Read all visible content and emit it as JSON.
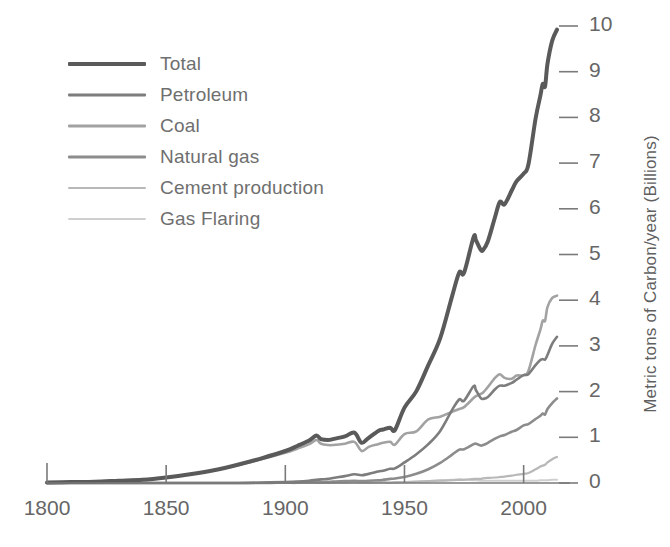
{
  "chart_data": {
    "type": "line",
    "title": "",
    "subtitle": "",
    "xlabel": "",
    "ylabel": "Metric tons of Carbon/year (Billions)",
    "xlim": [
      1800,
      2014
    ],
    "ylim": [
      0,
      10
    ],
    "xticks": [
      1800,
      1850,
      1900,
      1950,
      2000
    ],
    "xtick_labels": [
      "1800",
      "1850",
      "1900",
      "1950",
      "2000"
    ],
    "yticks": [
      0,
      1,
      2,
      3,
      4,
      5,
      6,
      7,
      8,
      9,
      10
    ],
    "ytick_labels": [
      "0",
      "1",
      "2",
      "3",
      "4",
      "5",
      "6",
      "7",
      "8",
      "9",
      "10"
    ],
    "grid": false,
    "legend_position": "upper-left",
    "axis_side": "right",
    "x": [
      1800,
      1810,
      1820,
      1830,
      1840,
      1850,
      1860,
      1870,
      1880,
      1890,
      1900,
      1905,
      1910,
      1913,
      1915,
      1918,
      1920,
      1925,
      1929,
      1932,
      1935,
      1939,
      1941,
      1944,
      1946,
      1950,
      1955,
      1960,
      1965,
      1970,
      1973,
      1975,
      1979,
      1980,
      1982,
      1983,
      1985,
      1988,
      1990,
      1992,
      1995,
      1997,
      2000,
      2002,
      2005,
      2007,
      2008,
      2009,
      2010,
      2012,
      2014
    ],
    "series": [
      {
        "name": "Total",
        "color": "#5a5a5a",
        "width": 4.0,
        "values": [
          0.01,
          0.02,
          0.03,
          0.05,
          0.07,
          0.12,
          0.19,
          0.28,
          0.4,
          0.54,
          0.7,
          0.81,
          0.93,
          1.04,
          0.96,
          0.94,
          0.96,
          1.02,
          1.1,
          0.88,
          0.99,
          1.14,
          1.17,
          1.21,
          1.16,
          1.65,
          2.01,
          2.58,
          3.17,
          4.09,
          4.61,
          4.6,
          5.38,
          5.31,
          5.1,
          5.1,
          5.29,
          5.82,
          6.15,
          6.1,
          6.4,
          6.6,
          6.77,
          6.97,
          7.97,
          8.47,
          8.73,
          8.68,
          9.17,
          9.68,
          9.92
        ]
      },
      {
        "name": "Petroleum",
        "color": "#7d7d7d",
        "width": 2.6,
        "values": [
          0.0,
          0.0,
          0.0,
          0.0,
          0.0,
          0.0,
          0.0,
          0.0,
          0.0,
          0.01,
          0.02,
          0.03,
          0.05,
          0.07,
          0.08,
          0.09,
          0.11,
          0.15,
          0.19,
          0.17,
          0.2,
          0.25,
          0.27,
          0.31,
          0.32,
          0.45,
          0.63,
          0.85,
          1.14,
          1.6,
          1.83,
          1.8,
          2.12,
          2.03,
          1.86,
          1.84,
          1.88,
          2.05,
          2.13,
          2.13,
          2.19,
          2.26,
          2.36,
          2.38,
          2.58,
          2.69,
          2.71,
          2.7,
          2.8,
          3.05,
          3.2
        ]
      },
      {
        "name": "Coal",
        "color": "#a2a2a2",
        "width": 2.6,
        "values": [
          0.01,
          0.02,
          0.03,
          0.05,
          0.07,
          0.12,
          0.19,
          0.28,
          0.39,
          0.52,
          0.66,
          0.75,
          0.85,
          0.94,
          0.86,
          0.83,
          0.83,
          0.86,
          0.9,
          0.7,
          0.79,
          0.85,
          0.88,
          0.9,
          0.84,
          1.07,
          1.13,
          1.39,
          1.45,
          1.56,
          1.62,
          1.66,
          1.86,
          1.9,
          1.95,
          1.98,
          2.1,
          2.3,
          2.38,
          2.3,
          2.28,
          2.35,
          2.36,
          2.45,
          3.02,
          3.35,
          3.55,
          3.55,
          3.85,
          4.05,
          4.1
        ]
      },
      {
        "name": "Natural gas",
        "color": "#8c8c8c",
        "width": 2.6,
        "values": [
          0.0,
          0.0,
          0.0,
          0.0,
          0.0,
          0.0,
          0.0,
          0.0,
          0.0,
          0.0,
          0.01,
          0.01,
          0.02,
          0.02,
          0.02,
          0.02,
          0.03,
          0.04,
          0.05,
          0.04,
          0.05,
          0.06,
          0.07,
          0.09,
          0.1,
          0.13,
          0.2,
          0.3,
          0.44,
          0.62,
          0.73,
          0.74,
          0.85,
          0.86,
          0.82,
          0.83,
          0.88,
          0.97,
          1.02,
          1.05,
          1.12,
          1.16,
          1.26,
          1.29,
          1.4,
          1.47,
          1.52,
          1.5,
          1.62,
          1.75,
          1.85
        ]
      },
      {
        "name": "Cement production",
        "color": "#b8b8b8",
        "width": 2.2,
        "values": [
          0.0,
          0.0,
          0.0,
          0.0,
          0.0,
          0.0,
          0.0,
          0.0,
          0.0,
          0.0,
          0.0,
          0.0,
          0.01,
          0.01,
          0.01,
          0.01,
          0.01,
          0.01,
          0.02,
          0.01,
          0.01,
          0.02,
          0.02,
          0.01,
          0.02,
          0.02,
          0.03,
          0.04,
          0.05,
          0.06,
          0.07,
          0.07,
          0.09,
          0.09,
          0.09,
          0.1,
          0.11,
          0.12,
          0.13,
          0.14,
          0.16,
          0.18,
          0.2,
          0.22,
          0.3,
          0.36,
          0.38,
          0.4,
          0.45,
          0.52,
          0.57
        ]
      },
      {
        "name": "Gas Flaring",
        "color": "#cfcfcf",
        "width": 2.0,
        "values": [
          0.0,
          0.0,
          0.0,
          0.0,
          0.0,
          0.0,
          0.0,
          0.0,
          0.0,
          0.0,
          0.0,
          0.0,
          0.0,
          0.0,
          0.0,
          0.0,
          0.01,
          0.01,
          0.01,
          0.01,
          0.01,
          0.01,
          0.01,
          0.01,
          0.01,
          0.02,
          0.03,
          0.04,
          0.06,
          0.07,
          0.08,
          0.07,
          0.06,
          0.06,
          0.05,
          0.05,
          0.05,
          0.05,
          0.05,
          0.05,
          0.05,
          0.05,
          0.05,
          0.05,
          0.05,
          0.06,
          0.06,
          0.06,
          0.06,
          0.07,
          0.07
        ]
      }
    ]
  },
  "legend": {
    "items": [
      {
        "label": "Total"
      },
      {
        "label": "Petroleum"
      },
      {
        "label": "Coal"
      },
      {
        "label": "Natural gas"
      },
      {
        "label": "Cement production"
      },
      {
        "label": "Gas Flaring"
      }
    ]
  },
  "axes": {
    "y_axis_title": "Metric tons of Carbon/year (Billions)"
  },
  "colors": {
    "background": "#ffffff",
    "axis": "#7a7a7a",
    "text": "#666666",
    "total": "#5a5a5a",
    "petroleum": "#7d7d7d",
    "coal": "#a2a2a2",
    "natural_gas": "#8c8c8c",
    "cement": "#b8b8b8",
    "gas_flaring": "#cfcfcf"
  }
}
